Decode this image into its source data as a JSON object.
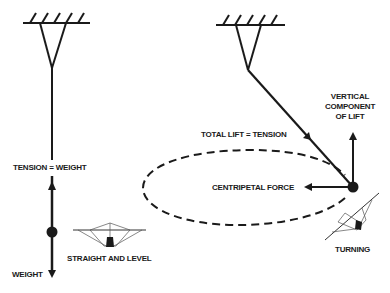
{
  "diagram": {
    "colors": {
      "ink": "#1a1a1a",
      "background": "#ffffff",
      "glider_lines": "#555555"
    },
    "left_panel": {
      "label_tension": "TENSION = WEIGHT",
      "label_weight": "WEIGHT",
      "label_state": "STRAIGHT AND LEVEL",
      "icons": [
        "ceiling-anchor-icon",
        "hang-glider-icon"
      ]
    },
    "right_panel": {
      "label_total_lift": "TOTAL LIFT = TENSION",
      "label_vertical_line1": "VERTICAL",
      "label_vertical_line2": "COMPONENT",
      "label_vertical_line3": "OF LIFT",
      "label_centripetal": "CENTRIPETAL FORCE",
      "label_state": "TURNING",
      "icons": [
        "ceiling-anchor-icon",
        "hang-glider-banked-icon"
      ]
    }
  }
}
